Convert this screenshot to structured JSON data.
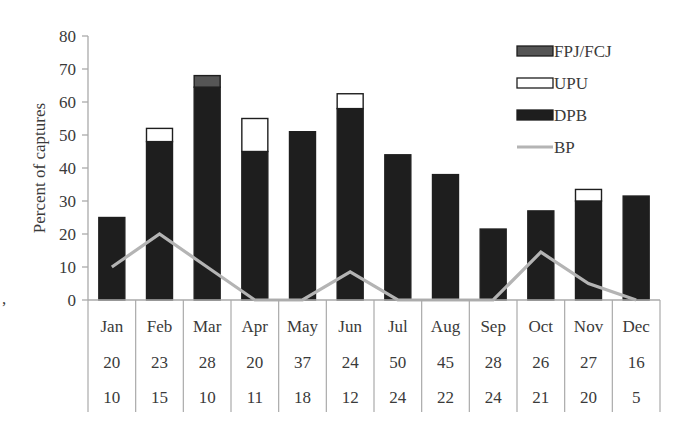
{
  "chart_data": {
    "type": "bar",
    "stacked": true,
    "title": "",
    "xlabel": "",
    "ylabel": "Percent of captures",
    "ylim": [
      0,
      80
    ],
    "yticks": [
      0,
      10,
      20,
      30,
      40,
      50,
      60,
      70,
      80
    ],
    "grid": false,
    "legend_position": "upper right",
    "categories": [
      "Jan",
      "Feb",
      "Mar",
      "Apr",
      "May",
      "Jun",
      "Jul",
      "Aug",
      "Sep",
      "Oct",
      "Nov",
      "Dec"
    ],
    "series": [
      {
        "name": "DPB",
        "kind": "bar",
        "color": "#1e1e1e",
        "values": [
          25,
          48,
          64.5,
          45,
          51,
          58,
          44,
          38,
          21.5,
          27,
          30,
          31.5
        ]
      },
      {
        "name": "UPU",
        "kind": "bar",
        "color": "#ffffff",
        "values": [
          0,
          4,
          0,
          10,
          0,
          4.5,
          0,
          0,
          0,
          0,
          3.5,
          0
        ]
      },
      {
        "name": "FPJ/FCJ",
        "kind": "bar",
        "color": "#555555",
        "values": [
          0,
          0,
          3.5,
          0,
          0,
          0,
          0,
          0,
          0,
          0,
          0,
          0
        ]
      },
      {
        "name": "BP",
        "kind": "line",
        "color": "#b4b4b4",
        "values": [
          10,
          20,
          10,
          0,
          0,
          8.5,
          0,
          0,
          0,
          14.5,
          5,
          0
        ]
      }
    ],
    "legend": [
      "FPJ/FCJ",
      "UPU",
      "DPB",
      "BP"
    ],
    "table_rows": [
      [
        "20",
        "23",
        "28",
        "20",
        "37",
        "24",
        "50",
        "45",
        "28",
        "26",
        "27",
        "16"
      ],
      [
        "10",
        "15",
        "10",
        "11",
        "18",
        "12",
        "24",
        "22",
        "24",
        "21",
        "20",
        "5"
      ]
    ]
  },
  "stray_mark": ","
}
